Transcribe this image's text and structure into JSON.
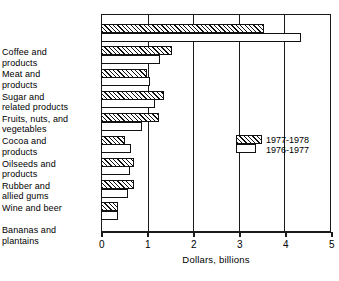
{
  "chart_data": {
    "type": "bar",
    "orientation": "horizontal",
    "title": "",
    "xlabel": "Dollars, billions",
    "ylabel": "",
    "xlim": [
      0,
      5
    ],
    "xticks": [
      "0",
      "1",
      "2",
      "3",
      "4",
      "5"
    ],
    "grid": true,
    "legend_position": "inside-right",
    "categories": [
      "Coffee and\nproducts",
      "Meat and\nproducts",
      "Sugar and\nrelated products",
      "Fruits, nuts, and\nvegetables",
      "Cocoa and\nproducts",
      "Oilseeds and\nproducts",
      "Rubber and\nallied gums",
      "Wine and beer",
      "Bananas and\nplantains"
    ],
    "series": [
      {
        "name": "1977-1978",
        "pattern": "hatched",
        "values": [
          3.55,
          1.55,
          1.0,
          1.38,
          1.26,
          0.52,
          0.72,
          0.72,
          0.38
        ]
      },
      {
        "name": "1976-1977",
        "pattern": "plain",
        "values": [
          4.35,
          1.28,
          1.07,
          1.17,
          0.9,
          0.65,
          0.63,
          0.58,
          0.36
        ]
      }
    ]
  },
  "legend": {
    "entries": [
      {
        "label": "1977-1978"
      },
      {
        "label": "1976-1977"
      }
    ]
  },
  "colors": {
    "ink": "#111111",
    "background": "#ffffff"
  }
}
